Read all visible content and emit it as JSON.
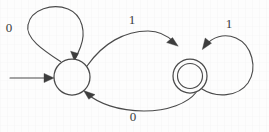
{
  "diagram": {
    "type": "dfa-state-diagram",
    "alphabet": [
      "0",
      "1"
    ],
    "stroke_color": "#4a4a4a",
    "background_color": "#fdfdfd",
    "states": [
      {
        "id": "q0",
        "kind": "start",
        "accepting": false,
        "label": "",
        "cx": 72,
        "cy": 77,
        "r": 18
      },
      {
        "id": "q1",
        "kind": "normal",
        "accepting": true,
        "label": "",
        "cx": 190,
        "cy": 76,
        "r": 17,
        "inner_r": 12.5
      }
    ],
    "start_arrow": {
      "name": "start-arrow",
      "from_x": 10,
      "to_x": 53,
      "y": 78
    },
    "transitions": [
      {
        "id": "t-self-left",
        "from": "q0",
        "to": "q0",
        "symbol": "0",
        "label_x": 9,
        "label_y": 29,
        "shape": "self-loop-top-left"
      },
      {
        "id": "t-top",
        "from": "q0",
        "to": "q1",
        "symbol": "1",
        "label_x": 132,
        "label_y": 21,
        "shape": "curve-upper"
      },
      {
        "id": "t-bottom",
        "from": "q1",
        "to": "q0",
        "symbol": "0",
        "label_x": 133,
        "label_y": 118,
        "shape": "curve-lower"
      },
      {
        "id": "t-self-right",
        "from": "q1",
        "to": "q1",
        "symbol": "1",
        "label_x": 229,
        "label_y": 25,
        "shape": "self-loop-right"
      }
    ]
  }
}
